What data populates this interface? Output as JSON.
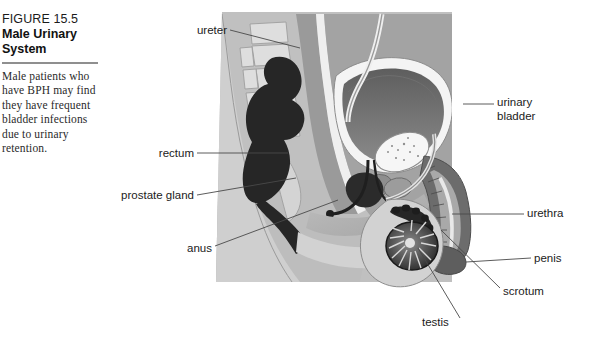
{
  "caption": {
    "figure_number": "FIGURE 15.5",
    "title_line_1": "Male Urinary",
    "title_line_2": "System",
    "body": "Male patients who have BPH may find they have frequent bladder infections due to urinary retention."
  },
  "figure": {
    "alt_name": "male-urinary-system-sagittal-diagram",
    "labels": {
      "ureter": "ureter",
      "rectum": "rectum",
      "prostate_gland": "prostate gland",
      "anus": "anus",
      "urinary_bladder_line_1": "urinary",
      "urinary_bladder_line_2": "bladder",
      "urethra": "urethra",
      "penis": "penis",
      "scrotum": "scrotum",
      "testis": "testis"
    }
  },
  "colors": {
    "page_background": "#ffffff",
    "caption_rule": "#8f8f8f",
    "label_text": "#1b1b1b",
    "leader_line": "#4a4a4a",
    "body_outer": "#c9c9c9",
    "body_mid": "#b4b4b4",
    "muscle_dark": "#8d8d8d",
    "organ_dark": "#3a3a3a",
    "organ_black": "#1e1e1e",
    "bone_light": "#dcdcdc",
    "cavity_light": "#efefef",
    "bladder_wall": "#f2f2f2"
  }
}
